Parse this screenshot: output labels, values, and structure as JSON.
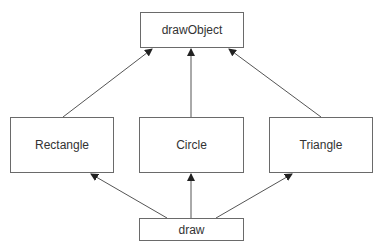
{
  "diagram": {
    "type": "class-hierarchy",
    "nodes": [
      {
        "id": "drawObject",
        "label": "drawObject"
      },
      {
        "id": "rectangle",
        "label": "Rectangle"
      },
      {
        "id": "circle",
        "label": "Circle"
      },
      {
        "id": "triangle",
        "label": "Triangle"
      },
      {
        "id": "draw",
        "label": "draw"
      }
    ],
    "edges": [
      {
        "from": "rectangle",
        "to": "drawObject"
      },
      {
        "from": "circle",
        "to": "drawObject"
      },
      {
        "from": "triangle",
        "to": "drawObject"
      },
      {
        "from": "draw",
        "to": "rectangle"
      },
      {
        "from": "draw",
        "to": "circle"
      },
      {
        "from": "draw",
        "to": "triangle"
      }
    ],
    "colors": {
      "line": "#555555",
      "border": "#6a6a6a",
      "text": "#333333"
    }
  }
}
